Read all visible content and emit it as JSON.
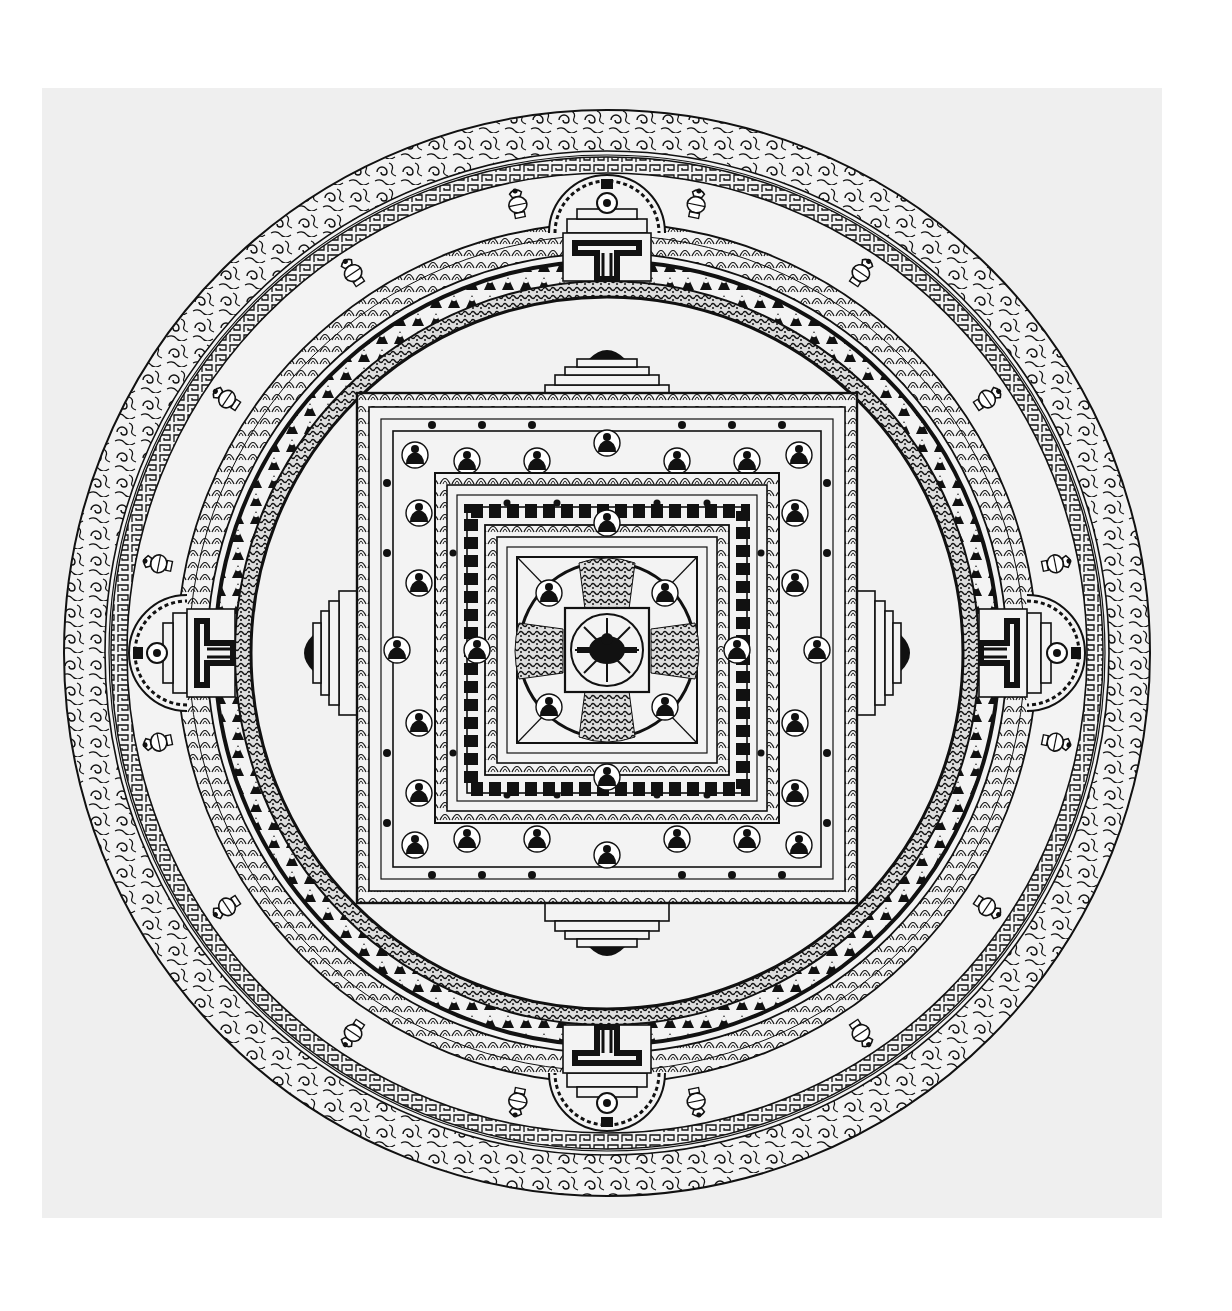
{
  "image": {
    "subject": "Tibetan Buddhist mandala line drawing",
    "style": "black ink on light gray paper",
    "colors": {
      "ink": "#111111",
      "paper": "#efefef",
      "background": "#ffffff",
      "disc": "#f2f2f2"
    }
  },
  "mandala": {
    "center": [
      607,
      653
    ],
    "rings": [
      {
        "name": "outer-cloud-band",
        "r_outer": 543,
        "r_inner": 500
      },
      {
        "name": "key-pattern-band",
        "r_outer": 500,
        "r_inner": 480
      },
      {
        "name": "offerings-band",
        "r_outer": 480,
        "r_inner": 430
      },
      {
        "name": "lotus-petal-band",
        "r_outer": 430,
        "r_inner": 395
      },
      {
        "name": "vajra-figures-band",
        "r_outer": 395,
        "r_inner": 355
      }
    ],
    "palace": {
      "half": 250,
      "levels": 4,
      "gates": [
        "north",
        "east",
        "south",
        "west"
      ]
    },
    "inner_circle": {
      "r": 90
    },
    "offering_vases_count": 16
  }
}
